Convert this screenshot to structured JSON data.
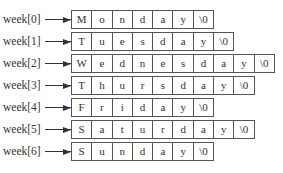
{
  "diagram": {
    "rows": [
      {
        "label": "week[0]",
        "chars": [
          "M",
          "o",
          "n",
          "d",
          "a",
          "y",
          "\\0"
        ]
      },
      {
        "label": "week[1]",
        "chars": [
          "T",
          "u",
          "e",
          "s",
          "d",
          "a",
          "y",
          "\\0"
        ]
      },
      {
        "label": "week[2]",
        "chars": [
          "W",
          "e",
          "d",
          "n",
          "e",
          "s",
          "d",
          "a",
          "y",
          "\\0"
        ]
      },
      {
        "label": "week[3]",
        "chars": [
          "T",
          "h",
          "u",
          "r",
          "s",
          "d",
          "a",
          "y",
          "\\0"
        ]
      },
      {
        "label": "week[4]",
        "chars": [
          "F",
          "r",
          "i",
          "d",
          "a",
          "y",
          "\\0"
        ]
      },
      {
        "label": "week[5]",
        "chars": [
          "S",
          "a",
          "t",
          "u",
          "r",
          "d",
          "a",
          "y",
          "\\0"
        ]
      },
      {
        "label": "week[6]",
        "chars": [
          "S",
          "u",
          "n",
          "d",
          "a",
          "y",
          "\\0"
        ]
      }
    ],
    "colors": {
      "line": "#555555",
      "text": "#333333",
      "background": "#ffffff"
    }
  }
}
